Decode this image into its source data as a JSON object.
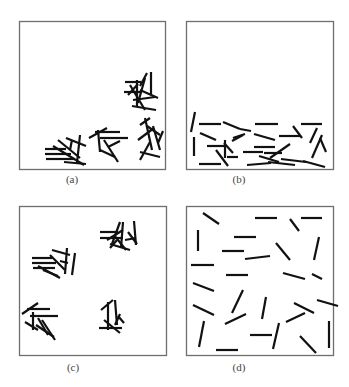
{
  "figure": {
    "frame_color": "#6e6e6e",
    "stick_color": "#111111",
    "stick_width": 2.2,
    "panels": [
      {
        "id": "a",
        "label": "(a)",
        "frame": {
          "x": 19,
          "y": 21,
          "w": 146,
          "h": 148
        },
        "label_pos": {
          "x": 72,
          "y": 173
        },
        "description": "sticks clustered in several tight heaps near bottom and right edges",
        "sticks": [
          [
            125,
            82,
            141,
            82
          ],
          [
            124,
            92,
            142,
            92
          ],
          [
            137,
            80,
            137,
            106
          ],
          [
            151,
            72,
            151,
            95
          ],
          [
            145,
            78,
            138,
            103
          ],
          [
            130,
            85,
            145,
            110
          ],
          [
            133,
            100,
            155,
            97
          ],
          [
            132,
            106,
            156,
            110
          ],
          [
            140,
            90,
            158,
            98
          ],
          [
            147,
            73,
            140,
            86
          ],
          [
            128,
            95,
            138,
            84
          ],
          [
            45,
            149,
            66,
            149
          ],
          [
            45,
            154,
            71,
            154
          ],
          [
            46,
            159,
            74,
            159
          ],
          [
            53,
            146,
            84,
            165
          ],
          [
            58,
            140,
            80,
            158
          ],
          [
            66,
            138,
            86,
            146
          ],
          [
            80,
            135,
            77,
            163
          ],
          [
            64,
            162,
            86,
            164
          ],
          [
            70,
            150,
            72,
            140
          ],
          [
            89,
            138,
            107,
            128
          ],
          [
            95,
            132,
            120,
            132
          ],
          [
            100,
            138,
            128,
            138
          ],
          [
            98,
            130,
            100,
            152
          ],
          [
            104,
            140,
            118,
            162
          ],
          [
            108,
            147,
            120,
            141
          ],
          [
            100,
            150,
            115,
            157
          ],
          [
            140,
            125,
            150,
            118
          ],
          [
            145,
            118,
            152,
            150
          ],
          [
            147,
            126,
            160,
            135
          ],
          [
            138,
            140,
            154,
            128
          ],
          [
            153,
            126,
            160,
            150
          ],
          [
            140,
            152,
            160,
            157
          ],
          [
            158,
            143,
            163,
            131
          ],
          [
            150,
            142,
            140,
            160
          ]
        ]
      },
      {
        "id": "b",
        "label": "(b)",
        "frame": {
          "x": 186,
          "y": 21,
          "w": 147,
          "h": 148
        },
        "label_pos": {
          "x": 239,
          "y": 173
        },
        "description": "sticks lying flat at bottom of container",
        "sticks": [
          [
            195,
            112,
            191,
            132
          ],
          [
            199,
            124,
            221,
            124
          ],
          [
            223,
            122,
            240,
            129
          ],
          [
            240,
            129,
            251,
            131
          ],
          [
            200,
            133,
            216,
            140
          ],
          [
            255,
            124,
            278,
            124
          ],
          [
            301,
            124,
            322,
            124
          ],
          [
            293,
            126,
            302,
            138
          ],
          [
            254,
            134,
            275,
            140
          ],
          [
            279,
            136,
            300,
            136
          ],
          [
            194,
            137,
            194,
            156
          ],
          [
            207,
            146,
            226,
            146
          ],
          [
            224,
            143,
            233,
            153
          ],
          [
            232,
            141,
            243,
            135
          ],
          [
            227,
            157,
            238,
            157
          ],
          [
            225,
            140,
            225,
            158
          ],
          [
            233,
            138,
            245,
            134
          ],
          [
            254,
            147,
            275,
            147
          ],
          [
            243,
            152,
            263,
            152
          ],
          [
            264,
            153,
            282,
            153
          ],
          [
            259,
            156,
            279,
            162
          ],
          [
            290,
            144,
            270,
            158
          ],
          [
            281,
            159,
            306,
            162
          ],
          [
            310,
            143,
            317,
            128
          ],
          [
            320,
            138,
            326,
            152
          ],
          [
            322,
            135,
            312,
            158
          ],
          [
            199,
            164,
            221,
            164
          ],
          [
            216,
            150,
            228,
            166
          ],
          [
            247,
            165,
            271,
            163
          ],
          [
            268,
            162,
            295,
            165
          ],
          [
            303,
            161,
            325,
            167
          ]
        ]
      },
      {
        "id": "c",
        "label": "(c)",
        "frame": {
          "x": 19,
          "y": 206,
          "w": 147,
          "h": 149
        },
        "label_pos": {
          "x": 73,
          "y": 361
        },
        "description": "sticks clustered into four separate heaps",
        "sticks": [
          [
            32,
            258,
            52,
            258
          ],
          [
            32,
            263,
            56,
            263
          ],
          [
            33,
            268,
            55,
            268
          ],
          [
            38,
            266,
            60,
            278
          ],
          [
            50,
            255,
            65,
            270
          ],
          [
            52,
            250,
            70,
            255
          ],
          [
            67,
            248,
            65,
            274
          ],
          [
            75,
            253,
            72,
            275
          ],
          [
            43,
            270,
            58,
            276
          ],
          [
            60,
            261,
            68,
            263
          ],
          [
            100,
            232,
            118,
            232
          ],
          [
            100,
            238,
            123,
            238
          ],
          [
            123,
            222,
            121,
            248
          ],
          [
            134,
            221,
            136,
            245
          ],
          [
            110,
            244,
            130,
            250
          ],
          [
            117,
            240,
            110,
            248
          ],
          [
            114,
            235,
            126,
            250
          ],
          [
            107,
            240,
            123,
            230
          ],
          [
            128,
            232,
            137,
            244
          ],
          [
            120,
            222,
            112,
            244
          ],
          [
            125,
            240,
            136,
            238
          ],
          [
            22,
            314,
            38,
            303
          ],
          [
            27,
            309,
            50,
            309
          ],
          [
            30,
            316,
            58,
            316
          ],
          [
            33,
            312,
            33,
            330
          ],
          [
            38,
            318,
            48,
            335
          ],
          [
            42,
            320,
            55,
            340
          ],
          [
            25,
            322,
            38,
            330
          ],
          [
            36,
            325,
            54,
            337
          ],
          [
            101,
            310,
            113,
            300
          ],
          [
            108,
            302,
            108,
            330
          ],
          [
            115,
            300,
            117,
            325
          ],
          [
            99,
            328,
            122,
            328
          ],
          [
            104,
            320,
            120,
            333
          ],
          [
            115,
            325,
            120,
            314
          ],
          [
            118,
            316,
            124,
            323
          ]
        ]
      },
      {
        "id": "d",
        "label": "(d)",
        "frame": {
          "x": 186,
          "y": 206,
          "w": 147,
          "h": 149
        },
        "label_pos": {
          "x": 239,
          "y": 361
        },
        "description": "sticks randomly dispersed across container",
        "sticks": [
          [
            203,
            213,
            219,
            224
          ],
          [
            255,
            218,
            277,
            218
          ],
          [
            290,
            219,
            299,
            231
          ],
          [
            301,
            218,
            322,
            218
          ],
          [
            198,
            230,
            198,
            251
          ],
          [
            234,
            237,
            256,
            237
          ],
          [
            276,
            243,
            290,
            260
          ],
          [
            319,
            237,
            314,
            260
          ],
          [
            222,
            251,
            244,
            251
          ],
          [
            245,
            259,
            270,
            256
          ],
          [
            191,
            265,
            214,
            265
          ],
          [
            226,
            275,
            248,
            275
          ],
          [
            283,
            273,
            305,
            279
          ],
          [
            312,
            274,
            322,
            279
          ],
          [
            193,
            283,
            214,
            291
          ],
          [
            243,
            290,
            232,
            313
          ],
          [
            266,
            297,
            262,
            319
          ],
          [
            294,
            303,
            314,
            313
          ],
          [
            317,
            300,
            338,
            306
          ],
          [
            193,
            305,
            214,
            315
          ],
          [
            225,
            324,
            246,
            314
          ],
          [
            286,
            322,
            305,
            313
          ],
          [
            204,
            321,
            199,
            347
          ],
          [
            250,
            335,
            272,
            335
          ],
          [
            279,
            323,
            273,
            349
          ],
          [
            329,
            321,
            329,
            348
          ],
          [
            216,
            350,
            238,
            350
          ],
          [
            300,
            336,
            316,
            353
          ]
        ]
      }
    ]
  }
}
